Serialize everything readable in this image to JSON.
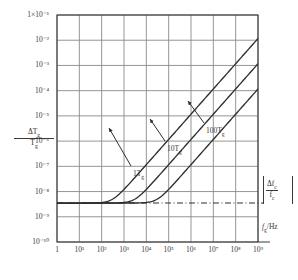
{
  "chart_data": {
    "type": "line",
    "title": "",
    "xlabel": "f_g /Hz",
    "xlabel_main": "f",
    "xlabel_sub": "g",
    "xlabel_unit": "/Hz",
    "ylabel": "ΔT_g / T_g",
    "ylabel_num": "ΔT",
    "ylabel_num_sub": "g",
    "ylabel_den": "T",
    "ylabel_den_sub": "g",
    "xscale": "log",
    "yscale": "log",
    "xlim": [
      1,
      1000000000
    ],
    "ylim": [
      1e-10,
      0.1
    ],
    "grid": true,
    "legend_position": "inline-annotations",
    "x_ticks": [
      1,
      10,
      100,
      1000,
      10000,
      100000,
      1000000,
      10000000,
      100000000,
      1000000000
    ],
    "x_tick_labels": [
      "1",
      "10¹",
      "10²",
      "10³",
      "10⁴",
      "10⁵",
      "10⁶",
      "10⁷",
      "10⁸",
      "10⁹"
    ],
    "y_ticks": [
      0.1,
      0.01,
      0.001,
      0.0001,
      1e-05,
      1e-06,
      1e-07,
      1e-08,
      1e-09,
      1e-10
    ],
    "y_tick_labels": [
      "1×10⁻¹",
      "10⁻²",
      "10⁻³",
      "10⁻⁴",
      "10⁻⁵",
      "10⁻⁶",
      "10⁻⁷",
      "10⁻⁸",
      "10⁻⁹",
      "10⁻¹⁰"
    ],
    "reference_line": {
      "label": "|Δf_c / f_c|",
      "num": "Δf",
      "num_sub": "c",
      "den": "f",
      "den_sub": "c",
      "value": 3.5e-09,
      "style": "dash-dot"
    },
    "series": [
      {
        "name": "1Tg",
        "label_main": "1T",
        "label_sub": "g",
        "color": "#2e2e2e",
        "asymptote_low": 3.5e-09,
        "knee_x": 30000,
        "points_x": [
          1,
          10,
          100,
          1000,
          10000,
          100000,
          1000000,
          10000000,
          100000000,
          1000000000
        ],
        "points_y": [
          3.5e-09,
          3.55e-09,
          3.9e-09,
          8e-09,
          4.2e-08,
          3.6e-07,
          3.5e-06,
          3.5e-05,
          0.00035,
          0.0035
        ]
      },
      {
        "name": "10Tg",
        "label_main": "10T",
        "label_sub": "g",
        "color": "#2e2e2e",
        "asymptote_low": 3.5e-09,
        "knee_x": 3000,
        "points_x": [
          1,
          10,
          100,
          1000,
          10000,
          100000,
          1000000,
          10000000,
          100000000,
          1000000000
        ],
        "points_y": [
          3.5e-09,
          3.9e-09,
          8e-09,
          4.2e-08,
          3.6e-07,
          3.5e-06,
          3.5e-05,
          0.00035,
          0.0035,
          0.035
        ]
      },
      {
        "name": "100Tg",
        "label_main": "100T",
        "label_sub": "g",
        "color": "#2e2e2e",
        "asymptote_low": 3.5e-09,
        "knee_x": 300,
        "points_x": [
          1,
          10,
          100,
          1000,
          10000,
          100000,
          1000000,
          10000000,
          100000000,
          1000000000
        ],
        "points_y": [
          3.5e-09,
          8e-09,
          4.2e-08,
          3.6e-07,
          3.5e-06,
          3.5e-05,
          0.00035,
          0.0035,
          0.035,
          0.35
        ]
      }
    ],
    "annotations": [
      {
        "name": "1Tg",
        "text_x": 133,
        "text_y": 169,
        "arrow_from_x": 131,
        "arrow_from_y": 166,
        "arrow_to_x": 109,
        "arrow_to_y": 128
      },
      {
        "name": "10Tg",
        "text_x": 167,
        "text_y": 144,
        "arrow_from_x": 165,
        "arrow_from_y": 141,
        "arrow_to_x": 150,
        "arrow_to_y": 119
      },
      {
        "name": "100Tg",
        "text_x": 206,
        "text_y": 126,
        "arrow_from_x": 204,
        "arrow_from_y": 123,
        "arrow_to_x": 188,
        "arrow_to_y": 101
      }
    ],
    "style": {
      "grid_color": "#8a8a8a",
      "axis_color": "#3a3a3a",
      "curve_color": "#2e2e2e",
      "background": "#ffffff"
    }
  },
  "plot_geometry": {
    "left": 57,
    "right": 258,
    "top": 15,
    "bottom": 242
  }
}
